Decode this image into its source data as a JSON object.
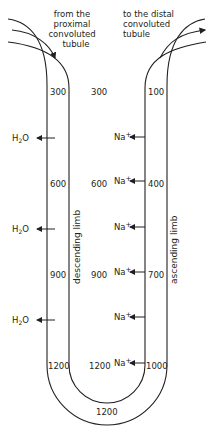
{
  "captions": {
    "inflow": "from the proximal convoluted tubule",
    "inflow_lines": [
      "from the proximal",
      "convoluted",
      "tubule"
    ],
    "outflow_lines": [
      "to the distal",
      "convoluted",
      "tubule"
    ]
  },
  "limbs": {
    "descending": "descending limb",
    "ascending": "ascending limb"
  },
  "descending_values": [
    "300",
    "600",
    "900",
    "1200"
  ],
  "interstitial_values": [
    "300",
    "600",
    "900",
    "1200"
  ],
  "ascending_values": [
    "100",
    "400",
    "700",
    "1000"
  ],
  "bottom_value": "1200",
  "water": {
    "base": "H",
    "sub": "2",
    "tail": "O"
  },
  "sodium": {
    "base": "Na",
    "sup": "+"
  },
  "colors": {
    "stroke": "#231f20",
    "background": "#ffffff"
  }
}
